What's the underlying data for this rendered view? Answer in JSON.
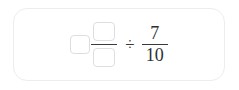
{
  "card": {
    "background_color": "#ffffff",
    "border_color": "#eceded"
  },
  "expression": {
    "mixed_number": {
      "whole_box": {
        "value": "",
        "placeholder": ""
      },
      "fraction": {
        "numerator_box": {
          "value": "",
          "placeholder": ""
        },
        "denominator_box": {
          "value": "",
          "placeholder": ""
        },
        "bar": "fraction-bar"
      }
    },
    "operator": {
      "symbol": "÷",
      "name": "division-sign"
    },
    "right_fraction": {
      "numerator": "7",
      "denominator": "10",
      "bar": "fraction-bar"
    }
  },
  "colors": {
    "text": "#2f2f2f",
    "rule": "#3a3a3a",
    "box_border": "#dcdedf",
    "card_border": "#eceded"
  }
}
